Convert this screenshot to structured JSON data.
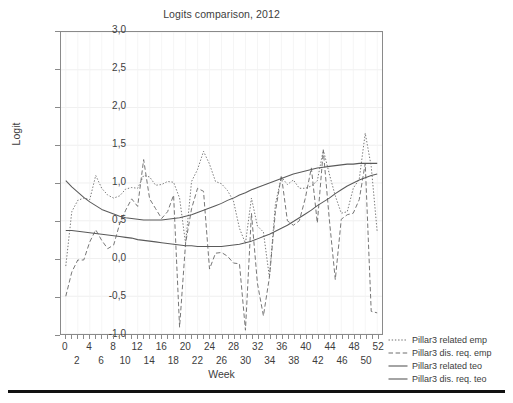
{
  "chart_data": {
    "type": "line",
    "title": "Logits comparison, 2012",
    "xlabel": "Week",
    "ylabel": "Logit",
    "xlim": [
      -0.8,
      52.8
    ],
    "ylim": [
      -1.0,
      3.0
    ],
    "grid": true,
    "legend_position": "right",
    "y_ticks": [
      "3,0",
      "2,5",
      "2,0",
      "1,5",
      "1,0",
      "0,5",
      "0,0",
      "-0,5",
      "-1,0"
    ],
    "y_tick_values": [
      3.0,
      2.5,
      2.0,
      1.5,
      1.0,
      0.5,
      0.0,
      -0.5,
      -1.0
    ],
    "x_ticks": [
      0,
      2,
      4,
      6,
      8,
      10,
      12,
      14,
      16,
      18,
      20,
      22,
      24,
      26,
      28,
      30,
      32,
      34,
      36,
      38,
      40,
      42,
      44,
      46,
      48,
      50,
      52
    ],
    "x_tick_labels_row_a": [
      0,
      4,
      8,
      12,
      16,
      20,
      24,
      28,
      32,
      36,
      40,
      44,
      48,
      52
    ],
    "x_tick_labels_row_b": [
      2,
      6,
      10,
      14,
      18,
      22,
      26,
      30,
      34,
      38,
      42,
      46,
      50
    ],
    "x": [
      0,
      1,
      2,
      3,
      4,
      5,
      6,
      7,
      8,
      9,
      10,
      11,
      12,
      13,
      14,
      15,
      16,
      17,
      18,
      19,
      20,
      21,
      22,
      23,
      24,
      25,
      26,
      27,
      28,
      29,
      30,
      31,
      32,
      33,
      34,
      35,
      36,
      37,
      38,
      39,
      40,
      41,
      42,
      43,
      44,
      45,
      46,
      47,
      48,
      49,
      50,
      51,
      52
    ],
    "series": [
      {
        "name": "Pillar3 related emp",
        "style": "dotted",
        "color": "#6e6e6e",
        "values": [
          -0.1,
          0.62,
          0.77,
          0.8,
          0.78,
          1.1,
          0.93,
          0.84,
          0.8,
          0.83,
          0.92,
          0.94,
          0.93,
          1.1,
          1.08,
          0.97,
          0.98,
          1.02,
          1.01,
          0.8,
          0.2,
          1.02,
          1.18,
          1.42,
          1.25,
          1.02,
          0.99,
          0.9,
          0.76,
          0.4,
          0.2,
          0.8,
          0.43,
          0.35,
          -0.25,
          0.72,
          1.08,
          0.98,
          1.04,
          0.93,
          0.93,
          0.96,
          1.03,
          1.44,
          1.12,
          0.83,
          0.6,
          0.62,
          0.93,
          1.05,
          1.66,
          1.22,
          0.35
        ]
      },
      {
        "name": "Pillar3 dis. req. emp",
        "style": "dashed",
        "color": "#6e6e6e",
        "values": [
          -0.5,
          -0.18,
          -0.02,
          -0.02,
          0.22,
          0.38,
          0.24,
          0.13,
          0.18,
          0.46,
          0.64,
          0.79,
          0.69,
          1.31,
          0.79,
          0.66,
          0.53,
          0.62,
          0.84,
          -0.91,
          0.2,
          0.66,
          0.93,
          0.89,
          -0.14,
          0.07,
          0.08,
          0.03,
          -0.06,
          -0.07,
          -0.95,
          0.6,
          -0.33,
          -0.76,
          -0.25,
          0.62,
          1.1,
          0.5,
          0.44,
          0.5,
          0.8,
          1.2,
          0.47,
          1.43,
          0.52,
          -0.28,
          0.52,
          0.58,
          0.6,
          0.78,
          1.26,
          -0.7,
          -0.72
        ]
      },
      {
        "name": "Pillar3 related teo",
        "style": "solid",
        "color": "#5a5a5a",
        "values": [
          1.03,
          0.95,
          0.88,
          0.81,
          0.75,
          0.7,
          0.65,
          0.62,
          0.59,
          0.56,
          0.54,
          0.53,
          0.52,
          0.51,
          0.51,
          0.51,
          0.51,
          0.52,
          0.53,
          0.54,
          0.56,
          0.58,
          0.61,
          0.64,
          0.67,
          0.7,
          0.73,
          0.77,
          0.8,
          0.84,
          0.87,
          0.91,
          0.94,
          0.97,
          1.0,
          1.03,
          1.06,
          1.09,
          1.12,
          1.14,
          1.16,
          1.18,
          1.2,
          1.21,
          1.22,
          1.23,
          1.24,
          1.25,
          1.25,
          1.26,
          1.26,
          1.26,
          1.26
        ]
      },
      {
        "name": "Pillar3 dis. req. teo",
        "style": "solid",
        "color": "#5a5a5a",
        "values": [
          0.37,
          0.37,
          0.36,
          0.35,
          0.34,
          0.33,
          0.32,
          0.31,
          0.3,
          0.29,
          0.28,
          0.27,
          0.25,
          0.24,
          0.23,
          0.22,
          0.21,
          0.2,
          0.19,
          0.18,
          0.17,
          0.17,
          0.16,
          0.16,
          0.16,
          0.16,
          0.16,
          0.17,
          0.18,
          0.19,
          0.21,
          0.23,
          0.26,
          0.29,
          0.32,
          0.36,
          0.4,
          0.44,
          0.49,
          0.54,
          0.59,
          0.64,
          0.7,
          0.75,
          0.8,
          0.86,
          0.91,
          0.96,
          1.0,
          1.04,
          1.07,
          1.1,
          1.12
        ]
      }
    ]
  }
}
